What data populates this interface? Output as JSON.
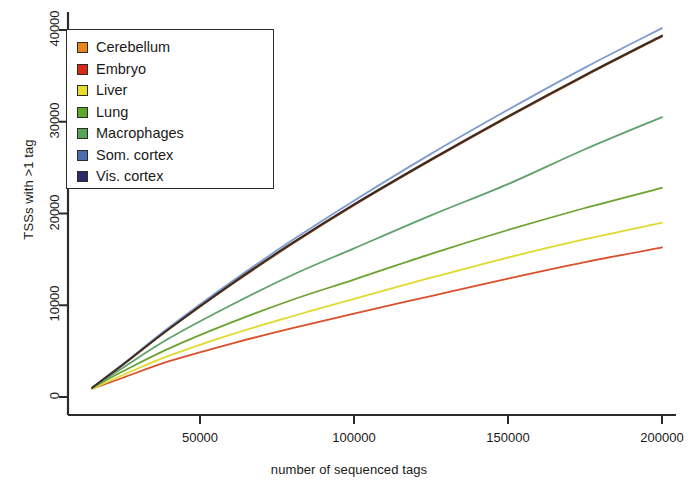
{
  "chart_data": {
    "type": "line",
    "title": "",
    "xlabel": "number of sequenced tags",
    "ylabel": "TSSs with >1 tag",
    "xlim": [
      12000,
      203000
    ],
    "ylim": [
      -1800,
      41800
    ],
    "xticks": [
      50000,
      100000,
      150000,
      200000
    ],
    "xticklabels": [
      "50000",
      "100000",
      "150000",
      "200000"
    ],
    "yticks": [
      0,
      10000,
      20000,
      30000,
      40000
    ],
    "yticklabels": [
      "0",
      "10000",
      "20000",
      "30000",
      "40000"
    ],
    "grid": false,
    "legend_position": "upper left",
    "x": [
      15000,
      25000,
      40000,
      60000,
      80000,
      100000,
      125000,
      150000,
      175000,
      200000
    ],
    "series": [
      {
        "name": "Cerebellum",
        "color": "#E8861B",
        "line_color": "#7A3B10",
        "values": [
          1000,
          3500,
          7400,
          12200,
          16700,
          20900,
          25800,
          30500,
          35000,
          39300
        ]
      },
      {
        "name": "Embryo",
        "color": "#D62B15",
        "line_color": "#D9502B",
        "values": [
          900,
          2100,
          3900,
          5800,
          7500,
          9100,
          11000,
          12900,
          14700,
          16300
        ]
      },
      {
        "name": "Liver",
        "color": "#E8DC2E",
        "line_color": "#E0D92E",
        "values": [
          900,
          2400,
          4500,
          6800,
          8800,
          10700,
          13000,
          15200,
          17200,
          19000
        ]
      },
      {
        "name": "Lung",
        "color": "#5DA82A",
        "line_color": "#6AA32F",
        "values": [
          1000,
          2800,
          5300,
          8100,
          10600,
          12800,
          15600,
          18200,
          20600,
          22800
        ]
      },
      {
        "name": "Macrophages",
        "color": "#54A55A",
        "line_color": "#5FA26A",
        "values": [
          1000,
          3200,
          6400,
          10000,
          13300,
          16200,
          19800,
          23200,
          27000,
          30500
        ]
      },
      {
        "name": "Som. cortex",
        "color": "#4A6FAE",
        "line_color": "#7E9BD0",
        "values": [
          1050,
          3600,
          7600,
          12500,
          17100,
          21400,
          26500,
          31300,
          35900,
          40200
        ]
      },
      {
        "name": "Vis. cortex",
        "color": "#2B2B6B",
        "line_color": "#3A2A22",
        "values": [
          1000,
          3550,
          7450,
          12300,
          16800,
          21000,
          25900,
          30600,
          35100,
          39400
        ]
      }
    ]
  },
  "legend": {
    "items": [
      {
        "label": "Cerebellum"
      },
      {
        "label": "Embryo"
      },
      {
        "label": "Liver"
      },
      {
        "label": "Lung"
      },
      {
        "label": "Macrophages"
      },
      {
        "label": "Som. cortex"
      },
      {
        "label": "Vis. cortex"
      }
    ]
  }
}
